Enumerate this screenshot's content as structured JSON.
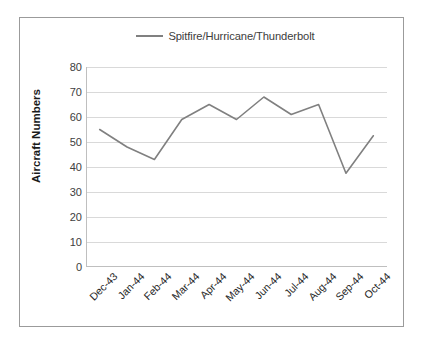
{
  "chart_data": {
    "type": "line",
    "title": "",
    "xlabel": "",
    "ylabel": "Aircraft Numbers",
    "ylim": [
      0,
      80
    ],
    "ytick_step": 10,
    "yticks": [
      80,
      70,
      60,
      50,
      40,
      30,
      20,
      10,
      0
    ],
    "grid": true,
    "legend_position": "top-center",
    "categories": [
      "Dec-43",
      "Jan-44",
      "Feb-44",
      "Mar-44",
      "Apr-44",
      "May-44",
      "Jun-44",
      "Jul-44",
      "Aug-44",
      "Sep-44",
      "Oct-44"
    ],
    "series": [
      {
        "name": "Spitfire/Hurricane/Thunderbolt",
        "color": "#808080",
        "values": [
          55,
          48,
          43,
          59,
          65,
          59,
          68,
          61,
          65,
          37.5,
          52.5
        ]
      }
    ]
  },
  "legend": {
    "entries": [
      {
        "label": "Spitfire/Hurricane/Thunderbolt",
        "swatch": "line-swatch-icon"
      }
    ]
  },
  "colors": {
    "series_line": "#808080",
    "gridline": "#d9d9d9",
    "axis": "#bfbfbf",
    "frame_border": "#9b9b9b",
    "background": "#ffffff",
    "tick_text": "#404040",
    "axis_title_text": "#1a1a1a"
  }
}
